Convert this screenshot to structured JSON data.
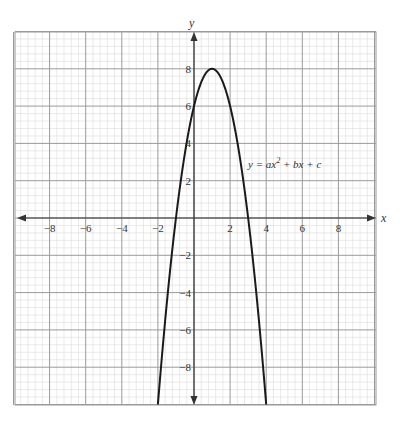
{
  "chart_data": {
    "type": "line",
    "title": "",
    "xlabel": "x",
    "ylabel": "y",
    "xlim": [
      -10,
      10
    ],
    "ylim": [
      -10,
      10
    ],
    "grid": true,
    "major_grid_step": 2,
    "minor_grid_step": 0.4,
    "x_ticks": [
      -8,
      -6,
      -4,
      -2,
      2,
      4,
      6,
      8
    ],
    "y_ticks": [
      8,
      6,
      4,
      2,
      -2,
      -4,
      -6,
      -8
    ],
    "annotation": "y = ax² + bx + c",
    "series": [
      {
        "name": "y = ax² + bx + c",
        "equation": "y = -2x² + 4x + 6",
        "a": -2,
        "b": 4,
        "c": 6,
        "vertex": [
          1,
          8
        ],
        "x_intercepts": [
          -1,
          3
        ],
        "y_intercept": 6,
        "x": [
          -2,
          -1.5,
          -1,
          -0.5,
          0,
          0.5,
          1,
          1.5,
          2,
          2.5,
          3,
          3.5,
          4
        ],
        "y": [
          -10,
          -6.5,
          0,
          3.5,
          6,
          7.5,
          8,
          7.5,
          6,
          3.5,
          0,
          -6.5,
          -10
        ]
      }
    ],
    "colors": {
      "curve": "#1a1a1a",
      "major_grid": "#9a9a9a",
      "minor_grid": "#dcdcdc",
      "axis": "#333333"
    }
  },
  "labels": {
    "x_axis": "x",
    "y_axis": "y",
    "equation_prefix": "y = ax",
    "equation_exp": "2",
    "equation_suffix": " + bx + c"
  }
}
